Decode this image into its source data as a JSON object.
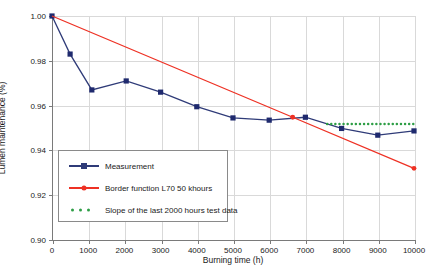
{
  "chart_data": {
    "type": "line",
    "title": "",
    "xlabel": "Burning time (h)",
    "ylabel": "Lumen maintenance (%)",
    "xlim": [
      0,
      10000
    ],
    "ylim": [
      0.9,
      1.0
    ],
    "xticks": [
      "0",
      "1000",
      "2000",
      "3000",
      "4000",
      "5000",
      "6000",
      "7000",
      "8000",
      "9000",
      "10000"
    ],
    "xtick_values": [
      0,
      1000,
      2000,
      3000,
      4000,
      5000,
      6000,
      7000,
      8000,
      9000,
      10000
    ],
    "yticks": [
      "0.90",
      "0.92",
      "0.94",
      "0.96",
      "0.98",
      "1.00"
    ],
    "ytick_values": [
      0.9,
      0.92,
      0.94,
      0.96,
      0.98,
      1.0
    ],
    "grid": true,
    "legend_position": "center-left-inside",
    "series": [
      {
        "name": "Measurement",
        "color": "#2f3b78",
        "marker": "square",
        "marker_color": "#1f2a6e",
        "style": "solid",
        "x": [
          0,
          500,
          1100,
          2050,
          3000,
          4000,
          5000,
          6000,
          7000,
          8000,
          9000,
          10000
        ],
        "y": [
          1.0,
          0.983,
          0.967,
          0.971,
          0.966,
          0.9595,
          0.9545,
          0.9535,
          0.9548,
          0.9498,
          0.9468,
          0.9487
        ]
      },
      {
        "name": "Border function L70 50 khours",
        "color": "#ee3124",
        "marker": "circle",
        "marker_color": "#ee3124",
        "style": "solid",
        "x": [
          0,
          6650,
          10000
        ],
        "y": [
          1.0,
          0.9548,
          0.932
        ]
      },
      {
        "name": "Slope of the last 2000 hours test data",
        "color": "#2e9e46",
        "marker": "none",
        "style": "dotted",
        "x": [
          7600,
          10000
        ],
        "y": [
          0.9518,
          0.9518
        ]
      }
    ]
  },
  "legend": {
    "items": [
      {
        "label": "Measurement",
        "color": "#2f3b78",
        "symbol": "line-square"
      },
      {
        "label": "Border function L70 50 khours",
        "color": "#ee3124",
        "symbol": "line-circle"
      },
      {
        "label": "Slope of the last 2000 hours test data",
        "color": "#2e9e46",
        "symbol": "dots"
      }
    ]
  },
  "axes": {
    "x_title": "Burning time (h)",
    "y_title": "Lumen maintenance (%)"
  }
}
